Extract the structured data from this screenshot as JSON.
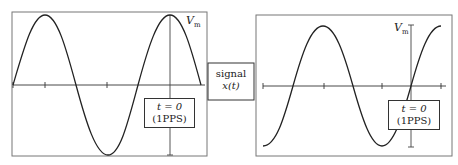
{
  "diagram": {
    "center_block": {
      "line1": "signal",
      "line2": "x(t)"
    },
    "left_panel": {
      "amplitude_label": "V",
      "amplitude_sub": "m",
      "marker_box": {
        "line1": "t = 0",
        "line2": "(1PPS)"
      },
      "waveform": "sine, phase 0 at left edge, peak at t=0"
    },
    "right_panel": {
      "amplitude_label": "V",
      "amplitude_sub": "m",
      "marker_box": {
        "line1": "t = 0",
        "line2": "(1PPS)"
      },
      "waveform": "sine, rising zero crossing at t=0"
    },
    "colors": {
      "line": "#222222",
      "frame": "#666666",
      "background": "#ffffff"
    }
  }
}
